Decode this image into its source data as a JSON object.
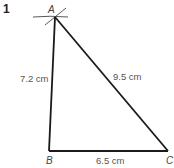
{
  "question_number": "1",
  "diagram": {
    "type": "triangle-construction",
    "vertices": [
      {
        "name": "A",
        "label": "A"
      },
      {
        "name": "B",
        "label": "B"
      },
      {
        "name": "C",
        "label": "C"
      }
    ],
    "sides": [
      {
        "from": "A",
        "to": "B",
        "label": "7.2 cm"
      },
      {
        "from": "A",
        "to": "C",
        "label": "9.5 cm"
      },
      {
        "from": "B",
        "to": "C",
        "label": "6.5 cm"
      }
    ],
    "construction_arcs_at": "A",
    "line_color": "#1a1a1a",
    "label_color": "#555555"
  }
}
